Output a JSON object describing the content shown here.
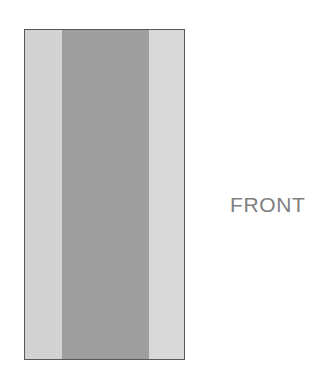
{
  "diagram": {
    "title": "",
    "outline": {
      "x": 24,
      "y": 29,
      "width": 161,
      "height": 331,
      "border_color": "#5a5a5a",
      "border_width": 1
    },
    "panels": [
      {
        "name": "left-stile",
        "label": "",
        "fill": "#d5d5d5",
        "x": 0,
        "width": 37
      },
      {
        "name": "center-panel",
        "label": "",
        "fill": "#a0a0a0",
        "x": 37,
        "width": 87
      },
      {
        "name": "right-stile",
        "label": "",
        "fill": "#dcdcdc",
        "x": 124,
        "width": 37
      }
    ],
    "dividers": [
      {
        "name": "left-divider",
        "x": 37,
        "color": "#3c3c3c",
        "segments": [
          {
            "top": 0,
            "height": 99
          },
          {
            "top": 107,
            "height": 160
          },
          {
            "top": 277,
            "height": 54
          }
        ]
      },
      {
        "name": "right-divider",
        "x": 124,
        "color": "#3c3c3c",
        "segments": [
          {
            "top": 0,
            "height": 99
          },
          {
            "top": 107,
            "height": 160
          },
          {
            "top": 277,
            "height": 54
          }
        ]
      }
    ]
  },
  "labels": {
    "front": "FRONT",
    "front_color": "#808080",
    "front_x": 230,
    "front_y": 194,
    "front_size": 21
  },
  "page": {
    "background": "#ffffff",
    "width": 327,
    "height": 388
  }
}
